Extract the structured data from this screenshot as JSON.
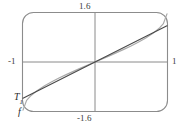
{
  "figure": {
    "kind": "graphing-calculator-plot"
  },
  "axis_labels": {
    "y_max": "1.6",
    "y_min": "-1.6",
    "x_min": "-1",
    "x_max": "1"
  },
  "curve_labels": {
    "t1_base": "T",
    "t1_sub": "1",
    "f": "f"
  },
  "colors": {
    "frame": "#8c8c8c",
    "axis": "#8a8a8a",
    "curve_f": "#a9a9a9",
    "curve_t1": "#4a4a4a",
    "text": "#2b2b2b",
    "background": "#ffffff"
  },
  "chart_data": {
    "type": "line",
    "title": "",
    "xlabel": "",
    "ylabel": "",
    "xlim": [
      -1,
      1
    ],
    "ylim": [
      -1.6,
      1.6
    ],
    "grid": false,
    "legend": "inline-curve-labels",
    "xticks": [
      -1,
      0,
      1
    ],
    "xticklabels": [
      "-1",
      "",
      "1"
    ],
    "yticks": [
      -1.6,
      0,
      1.6
    ],
    "yticklabels": [
      "-1.6",
      "",
      "1.6"
    ],
    "annotations": [
      {
        "text": "T1",
        "x": -0.93,
        "y": -1.18,
        "target": "tangent-line"
      },
      {
        "text": "f",
        "x": -0.9,
        "y": -1.5,
        "target": "function-curve"
      }
    ],
    "series": [
      {
        "name": "f",
        "style": "solid-light",
        "color": "#a9a9a9",
        "x": [
          -1.0,
          -0.95,
          -0.9,
          -0.8,
          -0.7,
          -0.6,
          -0.5,
          -0.4,
          -0.3,
          -0.2,
          -0.1,
          0.0,
          0.1,
          0.2,
          0.3,
          0.4,
          0.5,
          0.6,
          0.7,
          0.8,
          0.9,
          0.95,
          1.0
        ],
        "y": [
          -1.5708,
          -1.2532,
          -1.1198,
          -0.9273,
          -0.7754,
          -0.6435,
          -0.5236,
          -0.4115,
          -0.3047,
          -0.2014,
          -0.1002,
          0.0,
          0.1002,
          0.2014,
          0.3047,
          0.4115,
          0.5236,
          0.6435,
          0.7754,
          0.9273,
          1.1198,
          1.2532,
          1.5708
        ]
      },
      {
        "name": "T1",
        "style": "solid-dark",
        "color": "#4a4a4a",
        "x": [
          -1.0,
          -0.8,
          -0.6,
          -0.4,
          -0.2,
          0.0,
          0.2,
          0.4,
          0.6,
          0.8,
          1.0
        ],
        "y": [
          -1.18,
          -0.944,
          -0.708,
          -0.472,
          -0.236,
          0.0,
          0.236,
          0.472,
          0.708,
          0.944,
          1.18
        ]
      }
    ]
  }
}
